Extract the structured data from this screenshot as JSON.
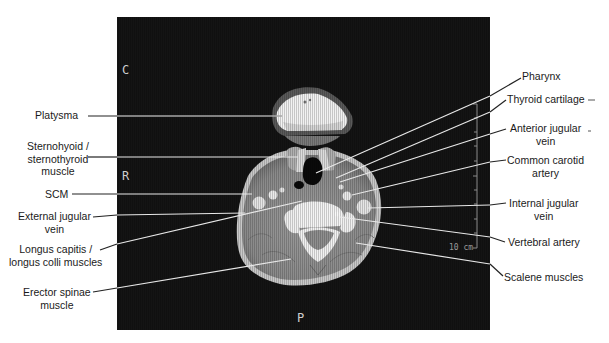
{
  "figure": {
    "orientation_markers": {
      "top": "C",
      "left": "R",
      "bottom": "P"
    },
    "scale_bar": {
      "label": "10 cm"
    },
    "labels_left": [
      {
        "id": "platysma",
        "text": "Platysma"
      },
      {
        "id": "sternohyoid",
        "text": "Sternohyoid / sternothyroid muscle",
        "lines": [
          "Sternohyoid /",
          "sternothyroid",
          "muscle"
        ]
      },
      {
        "id": "scm",
        "text": "SCM"
      },
      {
        "id": "external-jugular",
        "text": "External jugular vein",
        "lines": [
          "External jugular",
          "vein"
        ]
      },
      {
        "id": "longus",
        "text": "Longus capitis / longus colli muscles",
        "lines": [
          "Longus capitis /",
          "longus colli muscles"
        ]
      },
      {
        "id": "erector",
        "text": "Erector spinae muscle",
        "lines": [
          "Erector spinae",
          "muscle"
        ]
      }
    ],
    "labels_right": [
      {
        "id": "pharynx",
        "text": "Pharynx"
      },
      {
        "id": "thyroid-cartilage",
        "text": "Thyroid cartilage"
      },
      {
        "id": "anterior-jugular",
        "text": "Anterior jugular vein",
        "lines": [
          "Anterior jugular",
          "vein"
        ]
      },
      {
        "id": "common-carotid",
        "text": "Common carotid artery",
        "lines": [
          "Common carotid",
          "artery"
        ]
      },
      {
        "id": "internal-jugular",
        "text": "Internal jugular vein",
        "lines": [
          "Internal jugular",
          "vein"
        ]
      },
      {
        "id": "vertebral-artery",
        "text": "Vertebral artery"
      },
      {
        "id": "scalene",
        "text": "Scalene muscles"
      }
    ]
  }
}
